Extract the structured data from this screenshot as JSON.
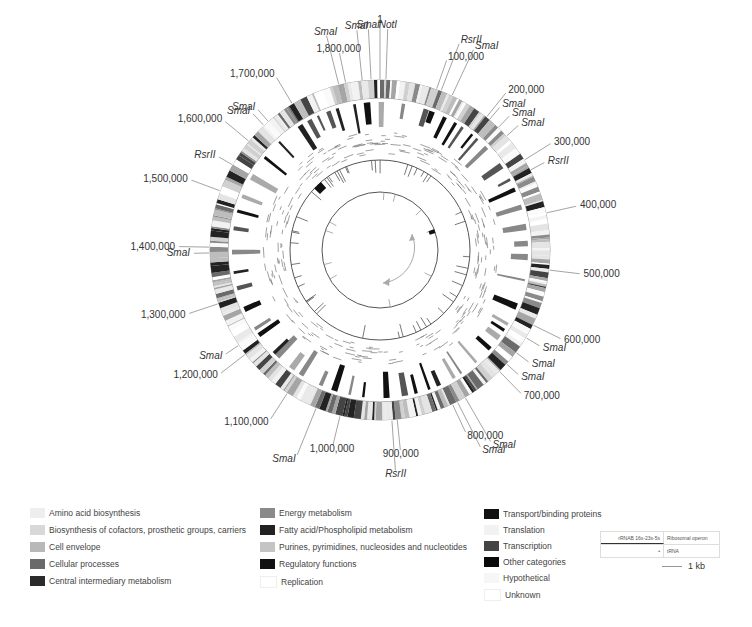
{
  "chart_data": {
    "type": "circular-genome-map",
    "center": [
      380,
      250
    ],
    "genome_length": 1860000,
    "coordinate_labels": [
      {
        "label": "1",
        "position": 0
      },
      {
        "label": "100,000",
        "position": 100000
      },
      {
        "label": "200,000",
        "position": 200000
      },
      {
        "label": "300,000",
        "position": 300000
      },
      {
        "label": "400,000",
        "position": 400000
      },
      {
        "label": "500,000",
        "position": 500000
      },
      {
        "label": "600,000",
        "position": 600000
      },
      {
        "label": "700,000",
        "position": 700000
      },
      {
        "label": "800,000",
        "position": 800000
      },
      {
        "label": "900,000",
        "position": 900000
      },
      {
        "label": "1,000,000",
        "position": 1000000
      },
      {
        "label": "1,100,000",
        "position": 1100000
      },
      {
        "label": "1,200,000",
        "position": 1200000
      },
      {
        "label": "1,300,000",
        "position": 1300000
      },
      {
        "label": "1,400,000",
        "position": 1400000
      },
      {
        "label": "1,500,000",
        "position": 1500000
      },
      {
        "label": "1,600,000",
        "position": 1600000
      },
      {
        "label": "1,700,000",
        "position": 1700000
      },
      {
        "label": "1,800,000",
        "position": 1800000
      }
    ],
    "restriction_sites": [
      {
        "label": "NotI",
        "angle": 2
      },
      {
        "label": "SmaI",
        "angle": -3
      },
      {
        "label": "SmaI",
        "angle": -6
      },
      {
        "label": "SmaI",
        "angle": -14
      },
      {
        "label": "RsrII",
        "angle": 21
      },
      {
        "label": "SmaI",
        "angle": 25
      },
      {
        "label": "SmaI",
        "angle": 40
      },
      {
        "label": "SmaI",
        "angle": 44
      },
      {
        "label": "SmaI",
        "angle": 48
      },
      {
        "label": "RsrII",
        "angle": 62
      },
      {
        "label": "SmaI",
        "angle": 121
      },
      {
        "label": "SmaI",
        "angle": 127
      },
      {
        "label": "SmaI",
        "angle": 132
      },
      {
        "label": "SmaI",
        "angle": 150
      },
      {
        "label": "SmaI",
        "angle": 153
      },
      {
        "label": "RsrII",
        "angle": 176
      },
      {
        "label": "SmaI",
        "angle": 202
      },
      {
        "label": "SmaI",
        "angle": 236
      },
      {
        "label": "SmaI",
        "angle": 269
      },
      {
        "label": "RsrII",
        "angle": 300
      },
      {
        "label": "SmaI",
        "angle": 317
      },
      {
        "label": "SmaI",
        "angle": 319
      }
    ],
    "rings": [
      {
        "name": "functional-category-genes",
        "r_outer": 170,
        "r_inner": 152
      },
      {
        "name": "highlighted-genes",
        "r_outer": 148,
        "r_inner": 118
      },
      {
        "name": "operon-scatter",
        "r_outer": 115,
        "r_inner": 94
      },
      {
        "name": "rRNA-tRNA-ticks-ring",
        "r": 90
      },
      {
        "name": "inner-ring",
        "r": 58
      }
    ]
  },
  "legend": {
    "col1": [
      {
        "label": "Amino acid biosynthesis",
        "color": "#eeeeee"
      },
      {
        "label": "Biosynthesis of cofactors, prosthetic groups, carriers",
        "color": "#d8d8d8"
      },
      {
        "label": "Cell envelope",
        "color": "#b8b8b8"
      },
      {
        "label": "Cellular processes",
        "color": "#6a6a6a"
      },
      {
        "label": "Central intermediary metabolism",
        "color": "#2b2b2b"
      }
    ],
    "col2": [
      {
        "label": "Energy metabolism",
        "color": "#8a8a8a"
      },
      {
        "label": "Fatty acid/Phospholipid metabolism",
        "color": "#222222"
      },
      {
        "label": "Purines, pyrimidines, nucleosides and nucleotides",
        "color": "#c4c4c4"
      },
      {
        "label": "Regulatory functions",
        "color": "#111111"
      },
      {
        "label": "Replication",
        "color": "#ffffff"
      }
    ],
    "col3": [
      {
        "label": "Transport/binding proteins",
        "color": "#111111"
      },
      {
        "label": "Translation",
        "color": "#f2f2f2"
      },
      {
        "label": "Transcription",
        "color": "#444444"
      },
      {
        "label": "Other categories",
        "color": "#0a0a0a"
      },
      {
        "label": "Hypothetical",
        "color": "#f6f6f6"
      },
      {
        "label": "Unknown",
        "color": "#ffffff"
      }
    ],
    "ribosomal_table": {
      "row1_left": "rRNAB 16s-23s-5s",
      "row1_right": "Ribosomal operon",
      "row2_left": "•",
      "row2_right": "tRNA"
    },
    "scale_bar": "1 kb"
  }
}
